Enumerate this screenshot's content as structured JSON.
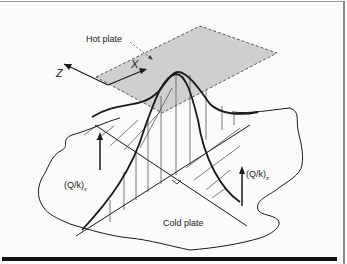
{
  "figure": {
    "labels": {
      "hot_plate": "Hot plate",
      "cold_plate": "Cold plate",
      "axis_x": "X",
      "axis_z": "Z",
      "flux_x": "(Q/k)",
      "flux_x_sub": "x",
      "flux_z": "(Q/k)",
      "flux_z_sub": "z"
    },
    "colors": {
      "hot_plate_fill": "#cfcfcf",
      "line": "#1a1a1a",
      "background": "#fbfbfb"
    }
  }
}
